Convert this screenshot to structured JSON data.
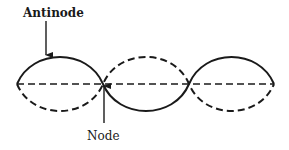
{
  "diagram": {
    "labels": {
      "antinode": "Antinode",
      "node": "Node"
    },
    "colors": {
      "stroke": "#1a1a1a",
      "background": "#ffffff"
    },
    "wave": {
      "segments": 3,
      "solid_curve": "displacement at one extreme",
      "dashed_curve": "displacement at opposite extreme",
      "equilibrium_line": "dashed"
    }
  }
}
